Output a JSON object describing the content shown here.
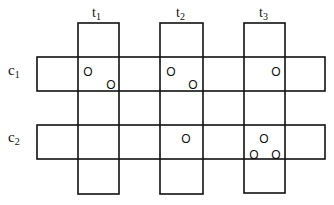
{
  "diagram": {
    "type": "grid-cross",
    "columns": [
      {
        "id": "t1",
        "label": "t",
        "sub": "1",
        "x": 78,
        "w": 41,
        "y": 23,
        "h": 171
      },
      {
        "id": "t2",
        "label": "t",
        "sub": "2",
        "x": 160,
        "w": 43,
        "y": 23,
        "h": 171
      },
      {
        "id": "t3",
        "label": "t",
        "sub": "3",
        "x": 244,
        "w": 41,
        "y": 23,
        "h": 170
      }
    ],
    "rows": [
      {
        "id": "c1",
        "label": "c",
        "sub": "1",
        "x": 37,
        "w": 288,
        "y": 57,
        "h": 34
      },
      {
        "id": "c2",
        "label": "c",
        "sub": "2",
        "x": 37,
        "w": 288,
        "y": 125,
        "h": 34
      }
    ],
    "markers": [
      {
        "cell": "c1-t1",
        "x": 88,
        "y": 72,
        "glyph": "O"
      },
      {
        "cell": "c1-t1",
        "x": 111,
        "y": 85,
        "glyph": "O"
      },
      {
        "cell": "c1-t2",
        "x": 171,
        "y": 72,
        "glyph": "O"
      },
      {
        "cell": "c1-t2",
        "x": 193,
        "y": 85,
        "glyph": "O"
      },
      {
        "cell": "c1-t3",
        "x": 276,
        "y": 72,
        "glyph": "O"
      },
      {
        "cell": "c2-t2",
        "x": 186,
        "y": 139,
        "glyph": "O"
      },
      {
        "cell": "c2-t3",
        "x": 264,
        "y": 139,
        "glyph": "O"
      },
      {
        "cell": "c2-t3",
        "x": 254,
        "y": 155,
        "glyph": "O"
      },
      {
        "cell": "c2-t3",
        "x": 276,
        "y": 155,
        "glyph": "O"
      }
    ],
    "labels": {
      "t1": "t1",
      "t2": "t2",
      "t3": "t3",
      "c1": "c1",
      "c2": "c2"
    },
    "stroke_color": "#111111",
    "background": "#ffffff"
  }
}
